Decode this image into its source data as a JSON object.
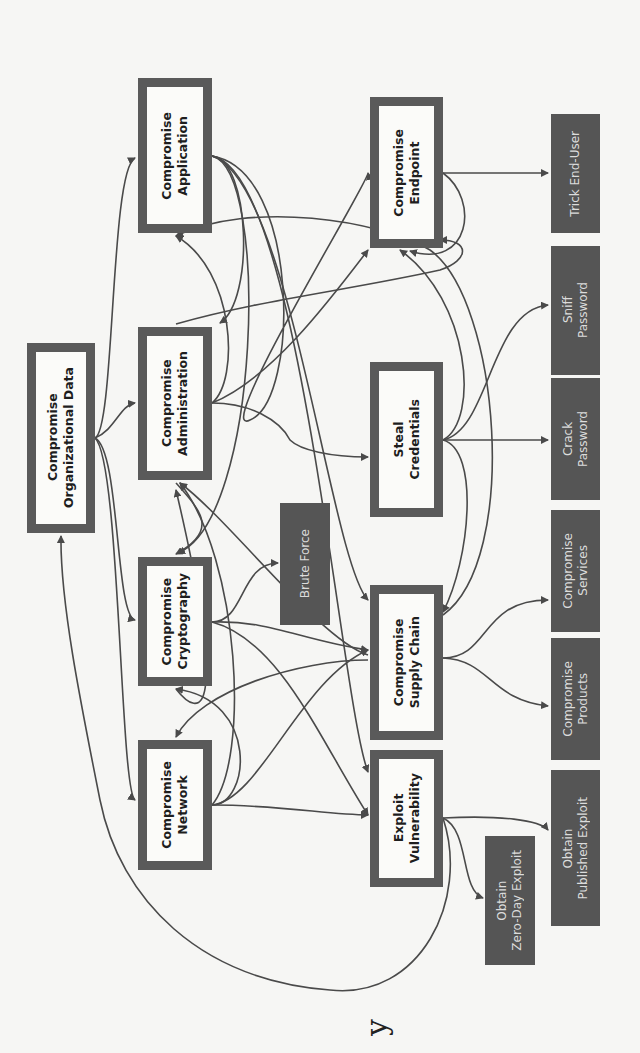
{
  "diagram": {
    "type": "attack-tree",
    "orientation": "rotated-90-ccw",
    "colors": {
      "background": "#f6f6f4",
      "goal_border": "#5a5a5a",
      "goal_fill": "#fbfbf9",
      "leaf_fill": "#555555",
      "leaf_text": "#dcdcdc",
      "edge": "#4a4a4a"
    },
    "nodes": [
      {
        "id": "org_data",
        "label": "Compromise\nOrganizational Data",
        "kind": "goal",
        "x": 27,
        "y": 343,
        "w": 68,
        "h": 190
      },
      {
        "id": "app",
        "label": "Compromise\nApplication",
        "kind": "goal",
        "x": 138,
        "y": 78,
        "w": 74,
        "h": 155
      },
      {
        "id": "admin",
        "label": "Compromise\nAdministration",
        "kind": "goal",
        "x": 138,
        "y": 327,
        "w": 74,
        "h": 153
      },
      {
        "id": "crypto",
        "label": "Compromise\nCryptography",
        "kind": "goal",
        "x": 138,
        "y": 557,
        "w": 74,
        "h": 129
      },
      {
        "id": "network",
        "label": "Compromise\nNetwork",
        "kind": "goal",
        "x": 138,
        "y": 740,
        "w": 74,
        "h": 130
      },
      {
        "id": "endpoint",
        "label": "Compromise\nEndpoint",
        "kind": "goal",
        "x": 370,
        "y": 97,
        "w": 73,
        "h": 151
      },
      {
        "id": "creds",
        "label": "Steal\nCredentials",
        "kind": "goal",
        "x": 370,
        "y": 362,
        "w": 73,
        "h": 155
      },
      {
        "id": "supply",
        "label": "Compromise\nSupply Chain",
        "kind": "goal",
        "x": 370,
        "y": 585,
        "w": 73,
        "h": 155
      },
      {
        "id": "vuln",
        "label": "Exploit\nVulnerability",
        "kind": "goal",
        "x": 370,
        "y": 750,
        "w": 73,
        "h": 137
      },
      {
        "id": "brute",
        "label": "Brute Force",
        "kind": "leaf",
        "x": 280,
        "y": 503,
        "w": 50,
        "h": 122
      },
      {
        "id": "trick",
        "label": "Trick End-User",
        "kind": "leaf",
        "x": 551,
        "y": 114,
        "w": 49,
        "h": 119
      },
      {
        "id": "sniff",
        "label": "Sniff\nPassword",
        "kind": "leaf",
        "x": 551,
        "y": 246,
        "w": 49,
        "h": 129
      },
      {
        "id": "crack",
        "label": "Crack\nPassword",
        "kind": "leaf",
        "x": 551,
        "y": 378,
        "w": 49,
        "h": 122
      },
      {
        "id": "services",
        "label": "Compromise\nServices",
        "kind": "leaf",
        "x": 551,
        "y": 510,
        "w": 49,
        "h": 122
      },
      {
        "id": "products",
        "label": "Compromise\nProducts",
        "kind": "leaf",
        "x": 551,
        "y": 638,
        "w": 49,
        "h": 122
      },
      {
        "id": "published",
        "label": "Obtain\nPublished Exploit",
        "kind": "leaf",
        "x": 551,
        "y": 770,
        "w": 49,
        "h": 156
      },
      {
        "id": "zeroday",
        "label": "Obtain\nZero-Day Exploit",
        "kind": "leaf",
        "x": 485,
        "y": 836,
        "w": 50,
        "h": 129
      }
    ],
    "edges": [
      {
        "from": "org_data",
        "to": "app"
      },
      {
        "from": "org_data",
        "to": "admin"
      },
      {
        "from": "org_data",
        "to": "crypto"
      },
      {
        "from": "org_data",
        "to": "network"
      },
      {
        "from": "app",
        "to": "admin"
      },
      {
        "from": "app",
        "to": "crypto"
      },
      {
        "from": "app",
        "to": "supply"
      },
      {
        "from": "app",
        "to": "vuln"
      },
      {
        "from": "app",
        "to": "endpoint"
      },
      {
        "from": "admin",
        "to": "creds"
      },
      {
        "from": "admin",
        "to": "app"
      },
      {
        "from": "admin",
        "to": "crypto"
      },
      {
        "from": "admin",
        "to": "endpoint"
      },
      {
        "from": "admin",
        "to": "supply"
      },
      {
        "from": "crypto",
        "to": "brute"
      },
      {
        "from": "crypto",
        "to": "supply"
      },
      {
        "from": "crypto",
        "to": "vuln"
      },
      {
        "from": "crypto",
        "to": "admin"
      },
      {
        "from": "network",
        "to": "crypto"
      },
      {
        "from": "network",
        "to": "supply"
      },
      {
        "from": "network",
        "to": "vuln"
      },
      {
        "from": "network",
        "to": "admin"
      },
      {
        "from": "endpoint",
        "to": "trick"
      },
      {
        "from": "endpoint",
        "to": "admin"
      },
      {
        "from": "endpoint",
        "to": "creds"
      },
      {
        "from": "endpoint",
        "to": "endpoint"
      },
      {
        "from": "creds",
        "to": "crack"
      },
      {
        "from": "creds",
        "to": "sniff"
      },
      {
        "from": "creds",
        "to": "endpoint"
      },
      {
        "from": "creds",
        "to": "app"
      },
      {
        "from": "creds",
        "to": "supply"
      },
      {
        "from": "supply",
        "to": "services"
      },
      {
        "from": "supply",
        "to": "products"
      },
      {
        "from": "supply",
        "to": "network"
      },
      {
        "from": "supply",
        "to": "admin"
      },
      {
        "from": "supply",
        "to": "app"
      },
      {
        "from": "vuln",
        "to": "published"
      },
      {
        "from": "vuln",
        "to": "zeroday"
      },
      {
        "from": "vuln",
        "to": "org_data"
      }
    ]
  },
  "stray_text": "y"
}
